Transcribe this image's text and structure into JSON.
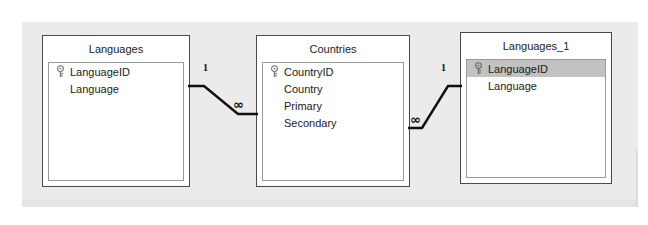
{
  "window": {
    "title": "Relationships",
    "canvas_background": "#ebebeb",
    "page_background": "#ffffff"
  },
  "diagram": {
    "type": "entity-relationship",
    "line_color": "#101010",
    "selection_color": "#c2c2c2",
    "tables": [
      {
        "id": "languages",
        "title": "Languages",
        "fields": [
          {
            "name": "LanguageID",
            "key": true,
            "selected": false
          },
          {
            "name": "Language",
            "key": false,
            "selected": false
          }
        ]
      },
      {
        "id": "countries",
        "title": "Countries",
        "fields": [
          {
            "name": "CountryID",
            "key": true,
            "selected": false
          },
          {
            "name": "Country",
            "key": false,
            "selected": false
          },
          {
            "name": "Primary",
            "key": false,
            "selected": false
          },
          {
            "name": "Secondary",
            "key": false,
            "selected": false
          }
        ]
      },
      {
        "id": "languages_1",
        "title": "Languages_1",
        "fields": [
          {
            "name": "LanguageID",
            "key": true,
            "selected": true
          },
          {
            "name": "Language",
            "key": false,
            "selected": false
          }
        ]
      }
    ],
    "relationships": [
      {
        "id": "rel-languages-countries",
        "from_table": "Languages",
        "to_table": "Countries",
        "from_cardinality": "1",
        "to_cardinality": "∞"
      },
      {
        "id": "rel-countries-languages1",
        "from_table": "Countries",
        "to_table": "Languages_1",
        "from_cardinality": "∞",
        "to_cardinality": "1"
      }
    ]
  },
  "icons": {
    "primary_key": "key-icon"
  }
}
